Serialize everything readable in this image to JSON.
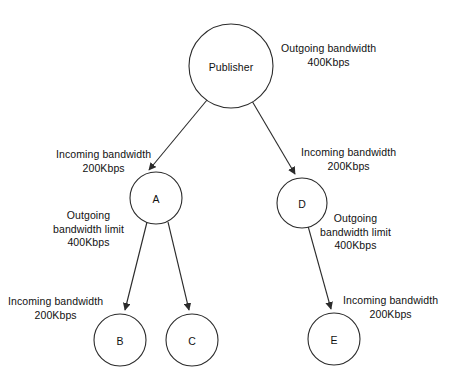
{
  "diagram": {
    "stroke_color": "#2b2b2b",
    "text_color": "#111111",
    "background_color": "#ffffff",
    "nodes": [
      {
        "id": "publisher",
        "label": "Publisher",
        "cx": 231,
        "cy": 66,
        "r": 42
      },
      {
        "id": "a",
        "label": "A",
        "cx": 156,
        "cy": 198,
        "r": 26
      },
      {
        "id": "d",
        "label": "D",
        "cx": 302,
        "cy": 203,
        "r": 25
      },
      {
        "id": "b",
        "label": "B",
        "cx": 120,
        "cy": 340,
        "r": 26
      },
      {
        "id": "c",
        "label": "C",
        "cx": 192,
        "cy": 340,
        "r": 26
      },
      {
        "id": "e",
        "label": "E",
        "cx": 334,
        "cy": 339,
        "r": 26
      }
    ],
    "edges": [
      {
        "id": "publisher-to-a",
        "from": "publisher",
        "to": "a"
      },
      {
        "id": "publisher-to-d",
        "from": "publisher",
        "to": "d"
      },
      {
        "id": "a-to-b",
        "from": "a",
        "to": "b"
      },
      {
        "id": "a-to-c",
        "from": "a",
        "to": "c"
      },
      {
        "id": "d-to-e",
        "from": "d",
        "to": "e"
      }
    ],
    "annotations": [
      {
        "id": "publisher-outgoing",
        "line1": "Outgoing bandwidth",
        "line2": "400Kbps",
        "line3": "",
        "x": 281,
        "y": 42,
        "align": "center"
      },
      {
        "id": "a-incoming",
        "line1": "Incoming bandwidth",
        "line2": "200Kbps",
        "line3": "",
        "x": 56,
        "y": 148,
        "align": "center"
      },
      {
        "id": "d-incoming",
        "line1": "Incoming bandwidth",
        "line2": "200Kbps",
        "line3": "",
        "x": 301,
        "y": 146,
        "align": "center"
      },
      {
        "id": "a-outgoing-limit",
        "line1": "Outgoing",
        "line2": "bandwidth limit",
        "line3": "400Kbps",
        "x": 53,
        "y": 209,
        "align": "center"
      },
      {
        "id": "d-outgoing-limit",
        "line1": "Outgoing",
        "line2": "bandwidth limit",
        "line3": "400Kbps",
        "x": 320,
        "y": 212,
        "align": "center"
      },
      {
        "id": "b-incoming",
        "line1": "Incoming bandwidth",
        "line2": "200Kbps",
        "line3": "",
        "x": 8,
        "y": 295,
        "align": "center"
      },
      {
        "id": "e-incoming",
        "line1": "Incoming bandwidth",
        "line2": "200Kbps",
        "line3": "",
        "x": 343,
        "y": 294,
        "align": "center"
      }
    ]
  }
}
